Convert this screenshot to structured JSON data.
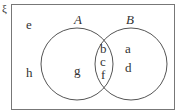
{
  "diagram": {
    "type": "venn",
    "universal_symbol": "ξ",
    "sets": [
      {
        "name": "A",
        "label": "A"
      },
      {
        "name": "B",
        "label": "B"
      }
    ],
    "regions": {
      "outside": [
        "e",
        "h"
      ],
      "only_A": [
        "g"
      ],
      "intersection": [
        "b",
        "c",
        "f"
      ],
      "only_B": [
        "a",
        "d"
      ]
    },
    "elements": {
      "e": "e",
      "h": "h",
      "g": "g",
      "b": "b",
      "c": "c",
      "f": "f",
      "a": "a",
      "d": "d"
    },
    "colors": {
      "line": "#555555",
      "text": "#333333",
      "background": "#ffffff"
    }
  }
}
